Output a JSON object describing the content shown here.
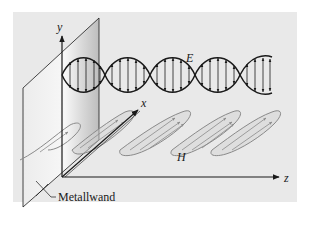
{
  "diagram": {
    "type": "electromagnetic-wave-reflection",
    "colors": {
      "background_panel": "#e9e9e9",
      "page": "#ffffff",
      "wall_fill_light": "#f4f4f4",
      "wall_fill_dark": "#c9c9c9",
      "line": "#1a1a1a",
      "h_field": "#8a8a8a"
    },
    "axes": {
      "y_label": "y",
      "x_label": "x",
      "z_label": "z"
    },
    "fields": {
      "e_label": "E",
      "h_label": "H"
    },
    "wall": {
      "label": "Metallwand"
    }
  }
}
